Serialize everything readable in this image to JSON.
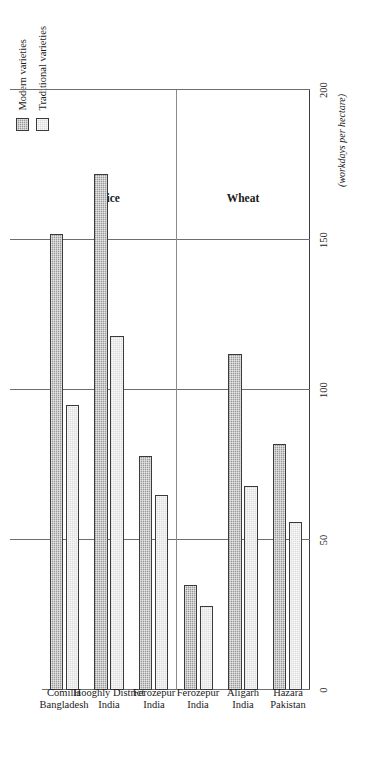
{
  "figure": {
    "units_note": "(workdays per hectare)",
    "orientation": "rotated-90-ccw",
    "sections": [
      {
        "id": "rice",
        "title": "Rice"
      },
      {
        "id": "wheat",
        "title": "Wheat"
      }
    ]
  },
  "legend": {
    "position": "top-right",
    "entries": [
      {
        "key": "modern",
        "label": "Modern varieties",
        "color": "#9a9a9a"
      },
      {
        "key": "traditional",
        "label": "Traditional varieties",
        "color": "#dcdcdc"
      }
    ]
  },
  "chart_data": {
    "type": "bar",
    "title": "",
    "subtitle": "",
    "xlabel": "",
    "ylabel": "(workdays per hectare)",
    "ylim": [
      0,
      200
    ],
    "yticks": [
      0,
      50,
      100,
      150,
      200
    ],
    "ytick_labels": [
      "0",
      "50",
      "100",
      "150",
      "200"
    ],
    "grid": true,
    "grid_axis": "value",
    "legend_position": "top-right",
    "group_labels": [
      "Rice",
      "Wheat"
    ],
    "categories": [
      {
        "place": "Comilla",
        "country": "Bangladesh",
        "group": "Rice"
      },
      {
        "place": "Hooghly District",
        "country": "India",
        "group": "Rice"
      },
      {
        "place": "Ferozepur",
        "country": "India",
        "group": "Rice"
      },
      {
        "place": "Ferozepur",
        "country": "India",
        "group": "Wheat"
      },
      {
        "place": "Aligarh",
        "country": "India",
        "group": "Wheat"
      },
      {
        "place": "Hazara",
        "country": "Pakistan",
        "group": "Wheat"
      }
    ],
    "category_labels": [
      "Comilla Bangladesh",
      "Hooghly District India",
      "Ferozepur India",
      "Ferozepur India",
      "Aligarh India",
      "Hazara Pakistan"
    ],
    "series": [
      {
        "name": "Modern varieties",
        "key": "modern",
        "values": [
          152,
          172,
          78,
          35,
          112,
          82
        ]
      },
      {
        "name": "Traditional varieties",
        "key": "traditional",
        "values": [
          95,
          118,
          65,
          28,
          68,
          56
        ]
      }
    ]
  }
}
